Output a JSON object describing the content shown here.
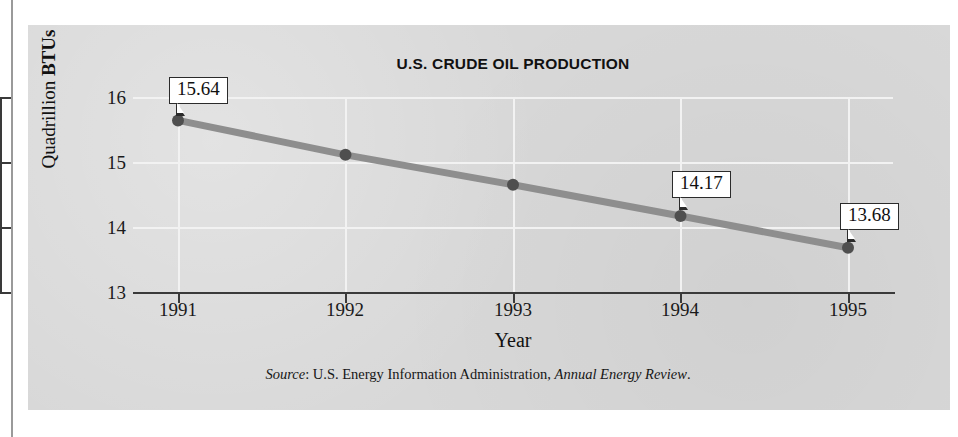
{
  "figure": {
    "title": "U.S. CRUDE OIL PRODUCTION",
    "y_axis_title_prefix": "Quadrillion ",
    "y_axis_title_emphasis": "BTUs",
    "x_axis_title": "Year",
    "source_prefix": "Source",
    "source_separator": ": ",
    "source_org": "U.S. Energy Information Administration, ",
    "source_publication": "Annual Energy Review",
    "source_suffix": ".",
    "colors": {
      "panel": "#d8d8d8",
      "line": "#8e8e8e",
      "marker": "#4f4f4f",
      "axis": "#3a3a3a",
      "gridline": "#f2f2f2",
      "text": "#111111",
      "callout_fill": "#ffffff",
      "callout_border": "#2b2b2b"
    }
  },
  "chart_data": {
    "type": "line",
    "title": "U.S. CRUDE OIL PRODUCTION",
    "xlabel": "Year",
    "ylabel": "Quadrillion BTUs",
    "categories": [
      "1991",
      "1992",
      "1993",
      "1994",
      "1995"
    ],
    "x": [
      1991,
      1992,
      1993,
      1994,
      1995
    ],
    "values": [
      15.64,
      15.11,
      14.65,
      14.17,
      13.68
    ],
    "point_labels": [
      "15.64",
      null,
      null,
      "14.17",
      "13.68"
    ],
    "ylim": [
      13,
      16
    ],
    "yticks": [
      13,
      14,
      15,
      16
    ],
    "ytick_labels": [
      "13",
      "14",
      "15",
      "16"
    ],
    "xtick_labels": [
      "1991",
      "1992",
      "1993",
      "1994",
      "1995"
    ],
    "grid": true,
    "legend": false,
    "series": [
      {
        "name": "U.S. crude oil production",
        "values": [
          15.64,
          15.11,
          14.65,
          14.17,
          13.68
        ]
      }
    ],
    "annotations": [
      {
        "label": "15.64",
        "x": "1991",
        "y": 15.64
      },
      {
        "label": "14.17",
        "x": "1994",
        "y": 14.17
      },
      {
        "label": "13.68",
        "x": "1995",
        "y": 13.68
      }
    ],
    "source": "Source: U.S. Energy Information Administration, Annual Energy Review."
  }
}
